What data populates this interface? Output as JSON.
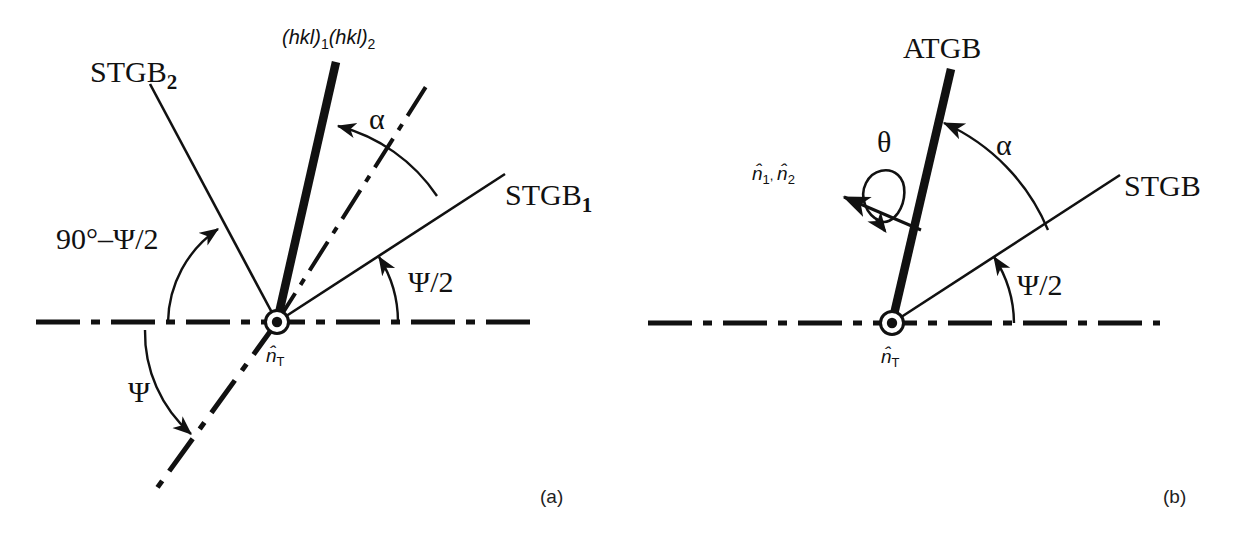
{
  "figure": {
    "background_color": "#ffffff",
    "line_color": "#111111",
    "width": 1250,
    "height": 545
  },
  "panel_a": {
    "tag": "(a)",
    "labels": {
      "stgb2": "STGB",
      "stgb2_sub": "2",
      "stgb1": "STGB",
      "stgb1_sub": "1",
      "planes": "(hkl)",
      "planes_sub1": "1",
      "planes2": "(hkl)",
      "planes_sub2": "2",
      "alpha": "α",
      "psi_half": "Ψ/2",
      "psi": "Ψ",
      "ninety_minus": "90°–Ψ/2",
      "axis_normal": "n",
      "axis_normal_sub": "T"
    },
    "geometry": {
      "origin_x": 277,
      "origin_y": 322,
      "stgb1_angle_deg": 33,
      "stgb2_angle_deg": 118,
      "boundary_plane_angle_deg": 79,
      "dashdot_bisector_angle_deg": 68,
      "alpha_value_deg": 11,
      "psi_half_value_deg": 33
    }
  },
  "panel_b": {
    "tag": "(b)",
    "labels": {
      "atgb": "ATGB",
      "stgb": "STGB",
      "alpha": "α",
      "theta": "θ",
      "psi_half": "Ψ/2",
      "normals": "n",
      "normals_sub1": "1",
      "normals_comma": ", ",
      "normals2": "n",
      "normals_sub2": "2",
      "axis_normal": "n",
      "axis_normal_sub": "T"
    },
    "geometry": {
      "origin_x": 892,
      "origin_y": 323,
      "stgb_angle_deg": 33,
      "atgb_angle_deg": 79,
      "alpha_value_deg": 46,
      "psi_half_value_deg": 33
    }
  }
}
